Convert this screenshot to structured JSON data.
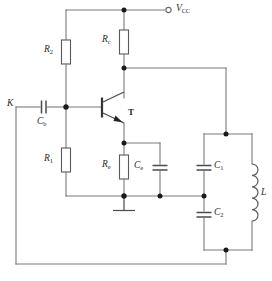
{
  "diagram": {
    "type": "schematic"
  },
  "terminals": {
    "supply": {
      "name": "supply-terminal",
      "label": "V",
      "sub": "CC",
      "symbol": "open-circle"
    },
    "input": {
      "name": "input-terminal",
      "label": "K"
    }
  },
  "components": [
    {
      "id": "R2",
      "label": "R",
      "sub": "2",
      "kind": "resistor",
      "role": "upper bias resistor"
    },
    {
      "id": "R1",
      "label": "R",
      "sub": "1",
      "kind": "resistor",
      "role": "lower bias resistor"
    },
    {
      "id": "Rc",
      "label": "R",
      "sub": "c",
      "kind": "resistor",
      "role": "collector resistor"
    },
    {
      "id": "Re",
      "label": "R",
      "sub": "e",
      "kind": "resistor",
      "role": "emitter resistor"
    },
    {
      "id": "Cb",
      "label": "C",
      "sub": "b",
      "kind": "capacitor",
      "role": "base coupling capacitor"
    },
    {
      "id": "Ce",
      "label": "C",
      "sub": "e",
      "kind": "capacitor",
      "role": "emitter bypass capacitor"
    },
    {
      "id": "C1",
      "label": "C",
      "sub": "1",
      "kind": "capacitor",
      "role": "tank capacitor 1"
    },
    {
      "id": "C2",
      "label": "C",
      "sub": "2",
      "kind": "capacitor",
      "role": "tank capacitor 2"
    },
    {
      "id": "L",
      "label": "L",
      "sub": "",
      "kind": "inductor",
      "role": "tank inductor"
    },
    {
      "id": "T",
      "label": "T",
      "sub": "",
      "kind": "transistor-npn",
      "role": "amplifying transistor"
    }
  ],
  "ground": {
    "name": "ground-symbol",
    "count": 1
  },
  "colors": {
    "wire": "#7a7a7a",
    "component_outline": "#5a5a5a",
    "node": "#1a1a1a",
    "text": "#2b2b2b",
    "background": "#ffffff"
  }
}
